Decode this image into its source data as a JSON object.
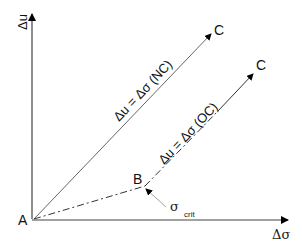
{
  "axes": {
    "y_label": "Δu",
    "x_label": "Δσ"
  },
  "points": {
    "origin": "A",
    "break": "B",
    "end_nc": "C",
    "end_oc": "C"
  },
  "paths": {
    "nc_label": "Δu = Δσ  (NC)",
    "oc_label": "Δu = Δσ  (OC)"
  },
  "annotation": {
    "symbol": "σ",
    "subscript": "crit"
  }
}
